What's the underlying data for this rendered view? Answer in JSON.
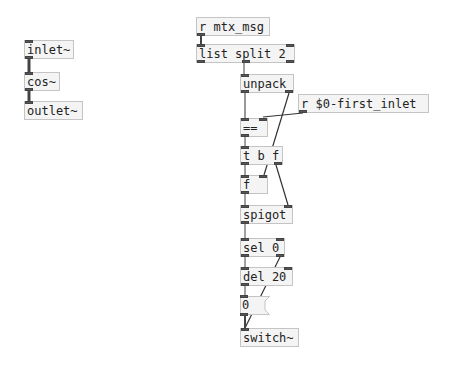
{
  "patch": {
    "objects": [
      {
        "id": "inlet",
        "text": "inlet~"
      },
      {
        "id": "cos",
        "text": "cos~"
      },
      {
        "id": "outlet",
        "text": "outlet~"
      },
      {
        "id": "r_mtx",
        "text": "r mtx_msg"
      },
      {
        "id": "list_split",
        "text": "list split 2"
      },
      {
        "id": "unpack",
        "text": "unpack"
      },
      {
        "id": "r_first",
        "text": "r $0-first_inlet"
      },
      {
        "id": "eq",
        "text": "=="
      },
      {
        "id": "tbf",
        "text": "t b f"
      },
      {
        "id": "f",
        "text": "f"
      },
      {
        "id": "spigot",
        "text": "spigot"
      },
      {
        "id": "sel",
        "text": "sel 0"
      },
      {
        "id": "del",
        "text": "del 20"
      },
      {
        "id": "msg0",
        "text": "0"
      },
      {
        "id": "switch",
        "text": "switch~"
      }
    ]
  },
  "colors": {
    "box_border": "#c4c4c4",
    "box_fill": "#f4f4f4",
    "wire": "#333333",
    "iolet": "#555555"
  }
}
